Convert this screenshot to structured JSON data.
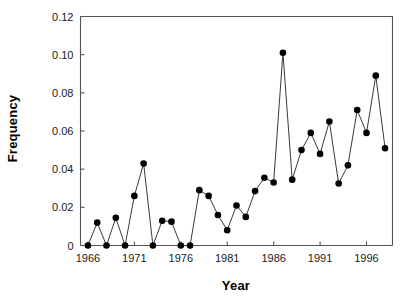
{
  "chart_data": {
    "type": "line",
    "title": "",
    "xlabel": "Year",
    "ylabel": "Frequency",
    "xlim": [
      1965.2,
      1998.8
    ],
    "ylim": [
      0,
      0.12
    ],
    "xticks": [
      1966,
      1971,
      1976,
      1981,
      1986,
      1991,
      1996
    ],
    "xtick_labels": [
      "1966",
      "1971",
      "1976",
      "1981",
      "1986",
      "1991",
      "1996"
    ],
    "yticks": [
      0,
      0.02,
      0.04,
      0.06,
      0.08,
      0.1,
      0.12
    ],
    "ytick_labels": [
      "0",
      "0.02",
      "0.04",
      "0.06",
      "0.08",
      "0.10",
      "0.12"
    ],
    "grid": false,
    "legend": false,
    "marker": "filled-circle",
    "marker_color": "#000000",
    "line_color": "#3a3a3a",
    "x": [
      1966,
      1967,
      1968,
      1969,
      1970,
      1971,
      1972,
      1973,
      1974,
      1975,
      1976,
      1977,
      1978,
      1979,
      1980,
      1981,
      1982,
      1983,
      1984,
      1985,
      1986,
      1987,
      1988,
      1989,
      1990,
      1991,
      1992,
      1993,
      1994,
      1995,
      1996,
      1997,
      1998
    ],
    "values": [
      0.0,
      0.012,
      0.0,
      0.0145,
      0.0,
      0.026,
      0.043,
      0.0,
      0.013,
      0.0125,
      0.0,
      0.0,
      0.029,
      0.026,
      0.016,
      0.008,
      0.021,
      0.015,
      0.0285,
      0.0355,
      0.033,
      0.101,
      0.0345,
      0.05,
      0.059,
      0.048,
      0.065,
      0.0325,
      0.042,
      0.071,
      0.059,
      0.089,
      0.051
    ],
    "series": [
      {
        "name": "Frequency",
        "values": [
          0.0,
          0.012,
          0.0,
          0.0145,
          0.0,
          0.026,
          0.043,
          0.0,
          0.013,
          0.0125,
          0.0,
          0.0,
          0.029,
          0.026,
          0.016,
          0.008,
          0.021,
          0.015,
          0.0285,
          0.0355,
          0.033,
          0.101,
          0.0345,
          0.05,
          0.059,
          0.048,
          0.065,
          0.0325,
          0.042,
          0.071,
          0.059,
          0.089,
          0.051
        ]
      }
    ]
  }
}
